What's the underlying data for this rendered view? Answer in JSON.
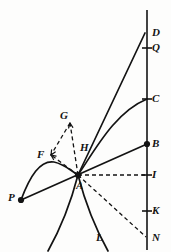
{
  "figure": {
    "background_color": "#fdfdfc",
    "ink_color": "#131313",
    "canvas": {
      "width": 171,
      "height": 252
    }
  },
  "axis": {
    "name": "vertical-axis",
    "x": 147,
    "y_top": 10,
    "y_bottom": 250
  },
  "points": [
    {
      "id": "D",
      "label": "D",
      "x": 145,
      "y": 33,
      "marker": "none",
      "label_x": 152,
      "label_y": 27
    },
    {
      "id": "Q",
      "label": "Q",
      "x": 147,
      "y": 48,
      "marker": "tick",
      "label_x": 152,
      "label_y": 42
    },
    {
      "id": "C",
      "label": "C",
      "x": 147,
      "y": 99,
      "marker": "tick",
      "label_x": 152,
      "label_y": 93
    },
    {
      "id": "B",
      "label": "B",
      "x": 147,
      "y": 144,
      "marker": "dot",
      "label_x": 152,
      "label_y": 138
    },
    {
      "id": "I",
      "label": "I",
      "x": 147,
      "y": 175,
      "marker": "tick",
      "label_x": 152,
      "label_y": 169
    },
    {
      "id": "K",
      "label": "K",
      "x": 147,
      "y": 211,
      "marker": "tick",
      "label_x": 152,
      "label_y": 205
    },
    {
      "id": "N",
      "label": "N",
      "x": 147,
      "y": 238,
      "marker": "none",
      "label_x": 152,
      "label_y": 232
    },
    {
      "id": "A",
      "label": "A",
      "x": 78,
      "y": 175,
      "marker": "dot",
      "label_x": 76,
      "label_y": 180
    },
    {
      "id": "P",
      "label": "P",
      "x": 21,
      "y": 200,
      "marker": "dot",
      "label_x": 8,
      "label_y": 192
    },
    {
      "id": "G",
      "label": "G",
      "x": 70,
      "y": 123,
      "marker": "none",
      "label_x": 60,
      "label_y": 110
    },
    {
      "id": "F",
      "label": "F",
      "x": 51,
      "y": 155,
      "marker": "none",
      "label_x": 37,
      "label_y": 149
    },
    {
      "id": "H",
      "label": "H",
      "x": 85,
      "y": 149,
      "marker": "none",
      "label_x": 80,
      "label_y": 142
    },
    {
      "id": "L",
      "label": "L",
      "x": 100,
      "y": 240,
      "marker": "none",
      "label_x": 96,
      "label_y": 232
    }
  ],
  "solid_lines": [
    {
      "name": "line-A-to-D",
      "from": "A",
      "to": "D",
      "x1": 78,
      "y1": 175,
      "x2": 145,
      "y2": 33
    },
    {
      "name": "line-P-to-B",
      "from": "P",
      "to": "B",
      "x1": 21,
      "y1": 200,
      "x2": 147,
      "y2": 144
    }
  ],
  "dashed_lines": [
    {
      "name": "dashed-A-to-I",
      "from": "A",
      "to": "I",
      "x1": 78,
      "y1": 175,
      "x2": 145,
      "y2": 175
    },
    {
      "name": "dashed-A-to-N",
      "from": "A",
      "to": "N",
      "x1": 78,
      "y1": 175,
      "x2": 146,
      "y2": 237
    },
    {
      "name": "dashed-A-to-G",
      "from": "A",
      "to": "G",
      "x1": 78,
      "y1": 175,
      "x2": 70,
      "y2": 123,
      "arrow": "to-G"
    },
    {
      "name": "dashed-G-to-F",
      "from": "G",
      "to": "F",
      "x1": 70,
      "y1": 123,
      "x2": 51,
      "y2": 155,
      "arrow": "to-F"
    },
    {
      "name": "dashed-A-to-F",
      "from": "A",
      "to": "F",
      "x1": 78,
      "y1": 175,
      "x2": 51,
      "y2": 155,
      "arrow": "to-F"
    }
  ],
  "curves": [
    {
      "name": "curve-A-to-C",
      "description": "concave arc rising from A and flattening into the axis at C",
      "path": "M 78 175 C 95 150 115 112 147 99"
    },
    {
      "name": "curve-P-hump-to-A",
      "description": "arc from P rising to a crest near (48,162) and descending to A",
      "path": "M 21 200 C 30 176 40 160 54 162 C 64 164 70 170 78 175"
    },
    {
      "name": "curve-A-down-left",
      "description": "branch descending steeply from A to the lower-left",
      "path": "M 78 175 C 72 198 62 226 48 251"
    },
    {
      "name": "curve-A-down-right",
      "description": "branch L descending steeply from A to the lower-right",
      "path": "M 78 175 C 84 198 94 226 108 251"
    }
  ],
  "ticks": {
    "half_width_left": 5,
    "half_width_right": 5
  }
}
